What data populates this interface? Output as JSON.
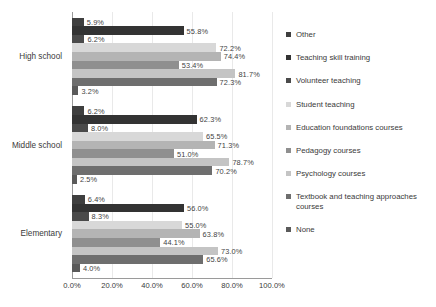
{
  "chart_data": {
    "type": "bar",
    "orientation": "horizontal",
    "title": "",
    "xlabel": "",
    "ylabel": "",
    "xlim": [
      0,
      100
    ],
    "grid": true,
    "legend_position": "right",
    "categories": [
      "High school",
      "Middle school",
      "Elementary"
    ],
    "tick_labels": [
      "0.0%",
      "20.0%",
      "40.0%",
      "60.0%",
      "80.0%",
      "100.0%"
    ],
    "tick_values": [
      0,
      20,
      40,
      60,
      80,
      100
    ],
    "value_suffix": "%",
    "series": [
      {
        "name": "Other",
        "color": "#3f3f3f",
        "values": [
          5.9,
          6.2,
          6.4
        ],
        "labels": [
          "5.9%",
          "6.2%",
          "6.4%"
        ]
      },
      {
        "name": "Teaching skill training",
        "color": "#333333",
        "values": [
          55.8,
          62.3,
          56.0
        ],
        "labels": [
          "55.8%",
          "62.3%",
          "56.0%"
        ]
      },
      {
        "name": "Volunteer teaching",
        "color": "#4a4a4a",
        "values": [
          6.2,
          8.0,
          8.3
        ],
        "labels": [
          "6.2%",
          "8.0%",
          "8.3%"
        ]
      },
      {
        "name": "Student teaching",
        "color": "#d8d8d8",
        "values": [
          72.2,
          65.5,
          55.0
        ],
        "labels": [
          "72.2%",
          "65.5%",
          "55.0%"
        ]
      },
      {
        "name": "Education foundations courses",
        "color": "#b4b4b4",
        "values": [
          74.4,
          71.3,
          63.8
        ],
        "labels": [
          "74.4%",
          "71.3%",
          "63.8%"
        ]
      },
      {
        "name": "Pedagogy courses",
        "color": "#8f8f8f",
        "values": [
          53.4,
          51.0,
          44.1
        ],
        "labels": [
          "53.4%",
          "51.0%",
          "44.1%"
        ]
      },
      {
        "name": "Psychology courses",
        "color": "#c4c4c4",
        "values": [
          81.7,
          78.7,
          73.0
        ],
        "labels": [
          "81.7%",
          "78.7%",
          "73.0%"
        ]
      },
      {
        "name": "Textbook and teaching approaches courses",
        "color": "#6e6e6e",
        "values": [
          72.3,
          70.2,
          65.6
        ],
        "labels": [
          "72.3%",
          "70.2%",
          "65.6%"
        ]
      },
      {
        "name": "None",
        "color": "#5a5a5a",
        "values": [
          3.2,
          2.5,
          4.0
        ],
        "labels": [
          "3.2%",
          "2.5%",
          "4.0%"
        ]
      }
    ]
  }
}
